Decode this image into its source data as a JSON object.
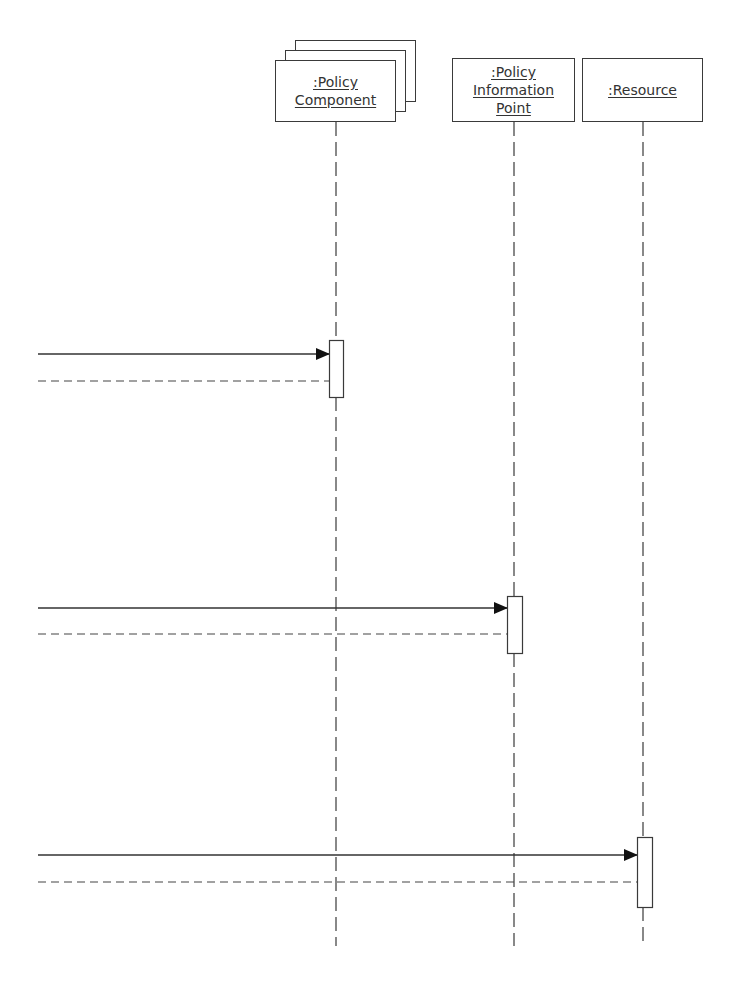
{
  "diagram": {
    "type": "UML sequence diagram",
    "lifelines": [
      {
        "id": "policy-component",
        "label_lines": [
          ":Policy",
          "Component"
        ],
        "multi_instance": true,
        "x": 336
      },
      {
        "id": "policy-information-point",
        "label_lines": [
          ":Policy",
          "Information",
          "Point"
        ],
        "multi_instance": false,
        "x": 514
      },
      {
        "id": "resource",
        "label_lines": [
          ":Resource"
        ],
        "multi_instance": false,
        "x": 643
      }
    ],
    "messages": [
      {
        "target": "policy-component",
        "type": "synchronous-call",
        "y": 354
      },
      {
        "target": "policy-component",
        "type": "return",
        "y": 381
      },
      {
        "target": "policy-information-point",
        "type": "synchronous-call",
        "y": 608
      },
      {
        "target": "policy-information-point",
        "type": "return",
        "y": 634
      },
      {
        "target": "resource",
        "type": "synchronous-call",
        "y": 855
      },
      {
        "target": "resource",
        "type": "return",
        "y": 882
      }
    ],
    "activations": [
      {
        "lifeline": "policy-component",
        "y_start": 340,
        "y_end": 397
      },
      {
        "lifeline": "policy-information-point",
        "y_start": 596,
        "y_end": 653
      },
      {
        "lifeline": "resource",
        "y_start": 837,
        "y_end": 907
      }
    ],
    "colors": {
      "line": "#3a3a3a",
      "text": "#333333",
      "background": "#ffffff"
    }
  }
}
